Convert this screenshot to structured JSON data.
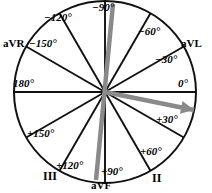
{
  "figure": {
    "name": "hexaxial-reference-system",
    "colors": {
      "background": "#ffffff",
      "line": "#111111",
      "circle": "#111111",
      "vector": "#8a8a8a",
      "text": "#000000"
    },
    "geometry": {
      "center_x": 105,
      "center_y": 92,
      "radius": 91,
      "spoke_step_deg": 30
    }
  },
  "angle_labels": [
    {
      "text": "−120°",
      "angle": -120,
      "x": 44,
      "y": 12
    },
    {
      "text": "−90°",
      "angle": -90,
      "x": 92,
      "y": 2
    },
    {
      "text": "−60°",
      "angle": -60,
      "x": 138,
      "y": 26
    },
    {
      "text": "−30°",
      "angle": -30,
      "x": 155,
      "y": 54
    },
    {
      "text": "0°",
      "angle": 0,
      "x": 178,
      "y": 78
    },
    {
      "text": "+30°",
      "angle": 30,
      "x": 156,
      "y": 114
    },
    {
      "text": "+60°",
      "angle": 60,
      "x": 140,
      "y": 146
    },
    {
      "text": "+90°",
      "angle": 90,
      "x": 101,
      "y": 166
    },
    {
      "text": "+120°",
      "angle": 120,
      "x": 56,
      "y": 160
    },
    {
      "text": "+150°",
      "angle": 150,
      "x": 27,
      "y": 128
    },
    {
      "text": "180°",
      "angle": 180,
      "x": 13,
      "y": 78
    },
    {
      "text": "−150°",
      "angle": -150,
      "x": 29,
      "y": 38
    }
  ],
  "lead_labels": [
    {
      "text": "aVR",
      "angle": -150,
      "x": 3,
      "y": 38
    },
    {
      "text": "aVL",
      "angle": -30,
      "x": 181,
      "y": 38
    },
    {
      "text": "aVF",
      "angle": 90,
      "x": 91,
      "y": 180
    },
    {
      "text": "II",
      "angle": 60,
      "x": 152,
      "y": 172
    },
    {
      "text": "III",
      "angle": 120,
      "x": 43,
      "y": 170
    }
  ],
  "vectors": [
    {
      "name": "mean-qrs-axis-arrow",
      "angle_deg": 18,
      "color": "#8a8a8a",
      "has_arrowhead": true,
      "x1": 105,
      "y1": 92,
      "x2": 194,
      "y2": 110
    },
    {
      "name": "near-vertical-axis-line",
      "angle_deg": 95,
      "color": "#8a8a8a",
      "has_arrowhead": false,
      "x1": 113,
      "y1": 4,
      "x2": 96,
      "y2": 180
    }
  ],
  "spokes": [
    {
      "angle": 0
    },
    {
      "angle": 30
    },
    {
      "angle": 60
    },
    {
      "angle": 90
    },
    {
      "angle": 120
    },
    {
      "angle": 150
    },
    {
      "angle": 180
    },
    {
      "angle": 210
    },
    {
      "angle": 240
    },
    {
      "angle": 270
    },
    {
      "angle": 300
    },
    {
      "angle": 330
    }
  ]
}
